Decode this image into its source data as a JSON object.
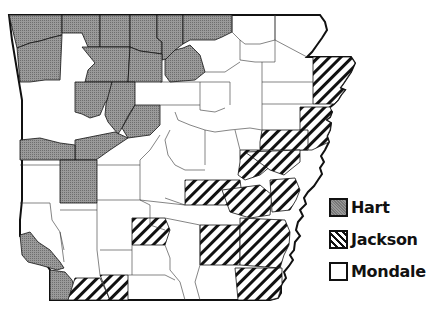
{
  "map": {
    "subject": "Arkansas counties",
    "colors": {
      "hart": "#8a8a8a",
      "jackson_stripe": "#111111",
      "mondale": "#ffffff",
      "border": "#111111"
    }
  },
  "legend": {
    "items": [
      {
        "key": "hart",
        "label": "Hart",
        "pattern": "stippled-gray"
      },
      {
        "key": "jackson",
        "label": "Jackson",
        "pattern": "diagonal-hatch"
      },
      {
        "key": "mondale",
        "label": "Mondale",
        "pattern": "white"
      }
    ]
  }
}
